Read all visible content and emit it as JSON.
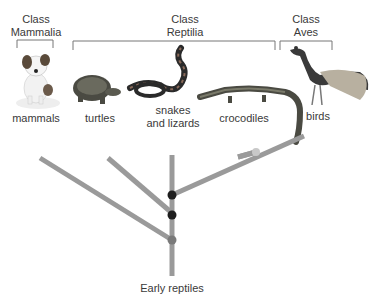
{
  "classes": [
    {
      "id": "mammalia",
      "line1": "Class",
      "line2": "Mammalia"
    },
    {
      "id": "reptilia",
      "line1": "Class",
      "line2": "Reptilia"
    },
    {
      "id": "aves",
      "line1": "Class",
      "line2": "Aves"
    }
  ],
  "groups": [
    {
      "id": "mammals",
      "label": "mammals",
      "icon": "dog-icon"
    },
    {
      "id": "turtles",
      "label": "turtles",
      "icon": "turtle-icon"
    },
    {
      "id": "snakes",
      "label_line1": "snakes",
      "label_line2": "and lizards",
      "icon": "snake-icon"
    },
    {
      "id": "crocodiles",
      "label": "crocodiles",
      "icon": "crocodile-icon"
    },
    {
      "id": "birds",
      "label": "birds",
      "icon": "peacock-icon"
    }
  ],
  "root": {
    "label": "Early reptiles"
  },
  "colors": {
    "branch": "#9a9a9a",
    "node_dark": "#1e1e1e",
    "node_gray": "#7a7a7a",
    "node_light": "#c8c8c8",
    "bracket": "#777777"
  }
}
